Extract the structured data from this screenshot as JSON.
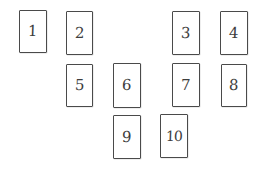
{
  "diagram": {
    "type": "numbered-card-layout",
    "title": "",
    "background_color": "#ffffff",
    "border_color": "#4a4a4a",
    "text_color": "#3d3d3d",
    "cards": [
      {
        "label": "1",
        "x": 19,
        "y": 10,
        "w": 28,
        "h": 43
      },
      {
        "label": "2",
        "x": 66,
        "y": 11,
        "w": 27,
        "h": 44
      },
      {
        "label": "3",
        "x": 172,
        "y": 11,
        "w": 28,
        "h": 44
      },
      {
        "label": "4",
        "x": 220,
        "y": 11,
        "w": 28,
        "h": 44
      },
      {
        "label": "5",
        "x": 66,
        "y": 64,
        "w": 27,
        "h": 43
      },
      {
        "label": "6",
        "x": 113,
        "y": 63,
        "w": 28,
        "h": 45
      },
      {
        "label": "7",
        "x": 172,
        "y": 63,
        "w": 28,
        "h": 44
      },
      {
        "label": "8",
        "x": 221,
        "y": 64,
        "w": 26,
        "h": 43
      },
      {
        "label": "9",
        "x": 113,
        "y": 115,
        "w": 28,
        "h": 44
      },
      {
        "label": "10",
        "x": 160,
        "y": 114,
        "w": 28,
        "h": 44
      }
    ]
  }
}
